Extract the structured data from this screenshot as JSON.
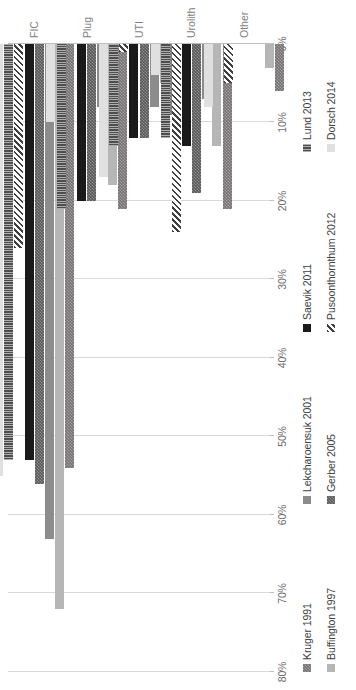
{
  "chart_data": {
    "type": "bar",
    "orientation": "horizontal",
    "title": "",
    "subtitle": "",
    "xlabel": "",
    "ylabel": "",
    "categories": [
      "FIC",
      "Plug",
      "UTI",
      "Urolith",
      "Other"
    ],
    "axis": {
      "ticks": [
        "0%",
        "10%",
        "20%",
        "30%",
        "40%",
        "50%",
        "60%",
        "70%",
        "80%"
      ],
      "tick_values": [
        0,
        10,
        20,
        30,
        40,
        50,
        60,
        70,
        80
      ],
      "min": 0,
      "max": 80,
      "unit": "%",
      "grid": true,
      "reversed": true
    },
    "legend": {
      "position": "bottom",
      "columns": 4,
      "rows": 2
    },
    "series": [
      {
        "name": "Kruger 1991",
        "key": "kruger",
        "color": "#767171",
        "pattern": "checker-dark",
        "values": [
          54,
          21,
          9,
          21,
          6
        ]
      },
      {
        "name": "Buffington 1997",
        "key": "buffington",
        "color": "#a6a6a6",
        "pattern": "solid-gray",
        "values": [
          72,
          18,
          5,
          13,
          3
        ]
      },
      {
        "name": "Lekcharoensuk 2001",
        "key": "lekcharoensuk",
        "color": "#8c8c8c",
        "pattern": "solid-gray",
        "values": [
          63,
          8,
          8,
          7,
          0
        ]
      },
      {
        "name": "Gerber 2005",
        "key": "gerber",
        "color": "#595959",
        "pattern": "checker-dark",
        "values": [
          56,
          20,
          12,
          19,
          0
        ]
      },
      {
        "name": "Saevik 2011",
        "key": "saevik",
        "color": "#1a1a1a",
        "pattern": "solid-black",
        "values": [
          53,
          20,
          12,
          13,
          0
        ]
      },
      {
        "name": "Pusoonthornthum 2012",
        "key": "pusoonthornthum",
        "color": "#3f3f3f",
        "pattern": "diagonal-hatch",
        "values": [
          26,
          0,
          1,
          24,
          5
        ]
      },
      {
        "name": "Lund 2013",
        "key": "lund",
        "color": "#4d4d4d",
        "pattern": "vertical-lines",
        "values": [
          53,
          21,
          13,
          12,
          0
        ]
      },
      {
        "name": "Dorsch 2014",
        "key": "dorsch",
        "color": "#d6d6d6",
        "pattern": "solid-light",
        "values": [
          55,
          10,
          17,
          4,
          8
        ]
      }
    ]
  }
}
